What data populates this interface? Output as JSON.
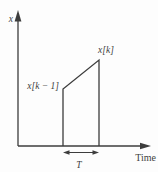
{
  "figure": {
    "y_axis": {
      "label": "x"
    },
    "x_axis": {
      "label": "Time"
    },
    "samples": {
      "current": "x[k]",
      "previous": "x[k − 1]"
    },
    "interval": {
      "label": "T"
    },
    "colors": {
      "line": "#3d3d3d",
      "text": "#3d3d3d",
      "background": "#fdfdfd"
    }
  }
}
